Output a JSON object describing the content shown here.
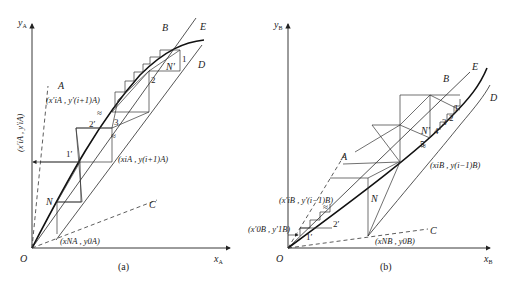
{
  "panel_a": {
    "caption": "(a)",
    "y_axis_label": "y",
    "y_axis_sub": "A",
    "x_axis_label": "x",
    "x_axis_sub": "A",
    "origin": "O",
    "line_labels": {
      "A": "A",
      "B": "B",
      "C": "C",
      "D": "D",
      "E": "E"
    },
    "point_labels": {
      "N": "N",
      "N_prime": "N′"
    },
    "stage_numbers": {
      "s1": "1",
      "s2": "2",
      "s3": "3",
      "s1p": "1′",
      "s2p": "2′"
    },
    "annotations": {
      "upper_pair": "(x′iA , y′(i+1)A)",
      "left_pair_vertical": "(x′iA , y′iA)",
      "mid_pair": "(xiA , y(i+1)A)",
      "bottom_pair": "(xNA , y0A)"
    }
  },
  "panel_b": {
    "caption": "(b)",
    "y_axis_label": "y",
    "y_axis_sub": "B",
    "x_axis_label": "x",
    "x_axis_sub": "B",
    "origin": "O",
    "line_labels": {
      "A": "A",
      "B": "B",
      "C": "C",
      "D": "D",
      "E": "E"
    },
    "point_labels": {
      "N": "N",
      "N_prime": "N′"
    },
    "stage_numbers": {
      "s1": "1",
      "s2": "2",
      "s3": "3",
      "s4": "4",
      "s5": "5",
      "s1p": "1′",
      "s2p": "2′"
    },
    "annotations": {
      "upper_left_pair": "(x′iB , y′(i−1)B)",
      "left_pair": "(x′0B , y′1B)",
      "right_pair": "(xiB , y(i−1)B)",
      "bottom_pair": "(xNB , y0B)"
    }
  }
}
